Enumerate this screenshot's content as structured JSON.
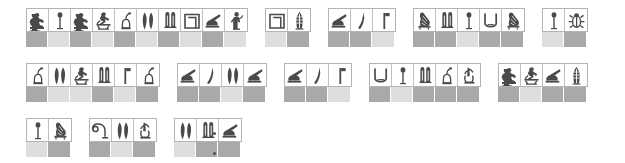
{
  "page": {
    "background_color": "#ffffff",
    "swatch_dark_color": "#a9a9a9",
    "swatch_light_color": "#dedede",
    "cell_border_color": "#b4b4b4",
    "ink_color": "#4a4a4a",
    "punctuation": "."
  },
  "rows": [
    {
      "name": "row-1",
      "top": 8,
      "left": 26,
      "groups": [
        {
          "name": "group-1-1",
          "glyphs": [
            "seated-man",
            "reed-leaf",
            "seated-man",
            "kneeling-figure",
            "jar-stand",
            "two-reeds",
            "tethering-rope",
            "house-enclosure",
            "seated-scribe",
            "standing-figure"
          ],
          "colors": [
            "dark",
            "light",
            "dark",
            "light",
            "dark",
            "light",
            "dark",
            "light",
            "dark",
            "light"
          ]
        },
        {
          "name": "group-1-2",
          "glyphs": [
            "house-enclosure",
            "feathered-reed"
          ],
          "colors": [
            "light",
            "dark"
          ]
        },
        {
          "name": "group-1-3",
          "glyphs": [
            "seated-scribe",
            "flowering-reed",
            "flagpole"
          ],
          "colors": [
            "dark",
            "dark",
            "light"
          ]
        },
        {
          "name": "group-1-4",
          "glyphs": [
            "vulture",
            "tethering-rope",
            "reed-leaf",
            "basket-vessel",
            "vulture"
          ],
          "colors": [
            "dark",
            "dark",
            "light",
            "dark",
            "dark"
          ]
        },
        {
          "name": "group-1-5",
          "glyphs": [
            "reed-leaf",
            "scarab-beetle"
          ],
          "colors": [
            "light",
            "dark"
          ]
        }
      ]
    },
    {
      "name": "row-2",
      "top": 63,
      "left": 26,
      "groups": [
        {
          "name": "group-2-1",
          "glyphs": [
            "jar-stand",
            "two-reeds",
            "kneeling-figure",
            "tethering-rope",
            "flagpole",
            "jar-stand"
          ],
          "colors": [
            "dark",
            "light",
            "light",
            "dark",
            "light",
            "dark"
          ]
        },
        {
          "name": "group-2-2",
          "glyphs": [
            "seated-scribe",
            "flowering-reed",
            "two-reeds",
            "seated-scribe"
          ],
          "colors": [
            "dark",
            "dark",
            "light",
            "dark"
          ]
        },
        {
          "name": "group-2-3",
          "glyphs": [
            "seated-scribe",
            "flowering-reed",
            "flagpole"
          ],
          "colors": [
            "dark",
            "dark",
            "light"
          ]
        },
        {
          "name": "group-2-4",
          "glyphs": [
            "basket-vessel",
            "reed-leaf",
            "tethering-rope",
            "jar-stand",
            "hand-branch"
          ],
          "colors": [
            "dark",
            "light",
            "dark",
            "dark",
            "dark"
          ]
        },
        {
          "name": "group-2-5",
          "glyphs": [
            "seated-man",
            "kneeling-figure",
            "seated-scribe",
            "feathered-reed"
          ],
          "colors": [
            "dark",
            "light",
            "dark",
            "dark"
          ]
        }
      ]
    },
    {
      "name": "row-3",
      "top": 118,
      "left": 26,
      "groups": [
        {
          "name": "group-3-1",
          "glyphs": [
            "reed-leaf",
            "vulture"
          ],
          "colors": [
            "light",
            "dark"
          ]
        },
        {
          "name": "group-3-2",
          "glyphs": [
            "coiled-rope",
            "two-reeds",
            "hand-branch"
          ],
          "colors": [
            "dark",
            "light",
            "dark"
          ]
        },
        {
          "name": "group-3-3",
          "glyphs": [
            "two-reeds",
            "tethering-rope",
            "seated-scribe"
          ],
          "colors": [
            "light",
            "dark",
            "dark"
          ]
        }
      ]
    }
  ],
  "periods": [
    {
      "name": "period-mark-upper",
      "x": 213,
      "y": 132
    },
    {
      "name": "period-mark-lower",
      "x": 213,
      "y": 152
    }
  ]
}
